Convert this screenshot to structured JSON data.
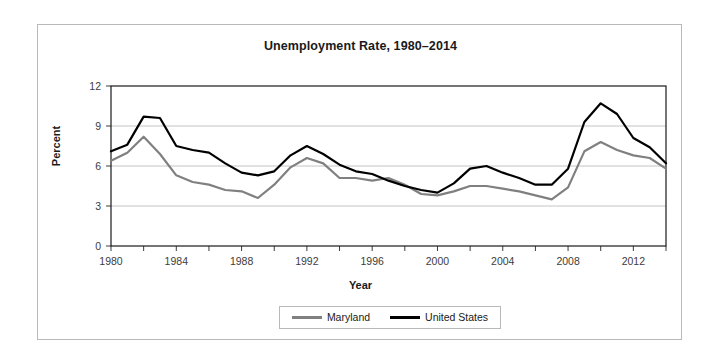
{
  "chart_data": {
    "type": "line",
    "title": "Unemployment Rate, 1980–2014",
    "xlabel": "Year",
    "ylabel": "Percent",
    "grid": "horizontal",
    "legend_position": "bottom",
    "xlim": [
      1980,
      2014
    ],
    "ylim": [
      0,
      12
    ],
    "yticks": [
      "0",
      "3",
      "6",
      "9",
      "12"
    ],
    "ytick_values": [
      0,
      3,
      6,
      9,
      12
    ],
    "xticks": [
      "1980",
      "1984",
      "1988",
      "1992",
      "1996",
      "2000",
      "2004",
      "2008",
      "2012"
    ],
    "xtick_values": [
      1980,
      1984,
      1988,
      1992,
      1996,
      2000,
      2004,
      2008,
      2012
    ],
    "xminor_step": 2,
    "x": [
      1980,
      1981,
      1982,
      1983,
      1984,
      1985,
      1986,
      1987,
      1988,
      1989,
      1990,
      1991,
      1992,
      1993,
      1994,
      1995,
      1996,
      1997,
      1998,
      1999,
      2000,
      2001,
      2002,
      2003,
      2004,
      2005,
      2006,
      2007,
      2008,
      2009,
      2010,
      2011,
      2012,
      2013,
      2014
    ],
    "series": [
      {
        "name": "Maryland",
        "color": "#808080",
        "values": [
          6.4,
          7.0,
          8.2,
          6.9,
          5.3,
          4.8,
          4.6,
          4.2,
          4.1,
          3.6,
          4.6,
          5.9,
          6.6,
          6.2,
          5.1,
          5.1,
          4.9,
          5.1,
          4.6,
          3.9,
          3.8,
          4.1,
          4.5,
          4.5,
          4.3,
          4.1,
          3.8,
          3.5,
          4.4,
          7.1,
          7.8,
          7.2,
          6.8,
          6.6,
          5.8
        ]
      },
      {
        "name": "United States",
        "color": "#000000",
        "values": [
          7.1,
          7.6,
          9.7,
          9.6,
          7.5,
          7.2,
          7.0,
          6.2,
          5.5,
          5.3,
          5.6,
          6.8,
          7.5,
          6.9,
          6.1,
          5.6,
          5.4,
          4.9,
          4.5,
          4.2,
          4.0,
          4.7,
          5.8,
          6.0,
          5.5,
          5.1,
          4.6,
          4.6,
          5.8,
          9.3,
          10.7,
          9.9,
          8.1,
          7.4,
          6.2
        ]
      }
    ]
  },
  "legend": {
    "items": [
      {
        "label": "Maryland",
        "color": "#808080"
      },
      {
        "label": "United States",
        "color": "#000000"
      }
    ]
  }
}
